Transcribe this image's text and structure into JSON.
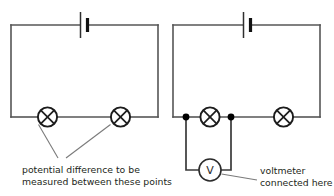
{
  "figure": {
    "background_color": "#ffffff",
    "wire_color": "#565656",
    "ink_color": "#231f20"
  },
  "circuits": [
    {
      "id": "circuit-left",
      "name": "circuit-without-voltmeter",
      "battery": {
        "label": "",
        "symbol": "battery-cell"
      },
      "lamps": [
        {
          "id": "lamp-left",
          "symbol": "lamp"
        },
        {
          "id": "lamp-right",
          "symbol": "lamp"
        }
      ],
      "nodes": [],
      "annotation": {
        "name": "potential-difference-label",
        "line1": "potential difference to be",
        "line2": "measured between these points"
      }
    },
    {
      "id": "circuit-right",
      "name": "circuit-with-voltmeter",
      "battery": {
        "label": "",
        "symbol": "battery-cell"
      },
      "lamps": [
        {
          "id": "lamp-left",
          "symbol": "lamp"
        },
        {
          "id": "lamp-right",
          "symbol": "lamp"
        }
      ],
      "nodes": [
        {
          "id": "node-a",
          "symbol": "junction-dot"
        },
        {
          "id": "node-b",
          "symbol": "junction-dot"
        }
      ],
      "voltmeter": {
        "id": "voltmeter",
        "symbol": "voltmeter",
        "letter": "V"
      },
      "annotation": {
        "name": "voltmeter-label",
        "line1": "voltmeter",
        "line2": "connected here"
      }
    }
  ]
}
